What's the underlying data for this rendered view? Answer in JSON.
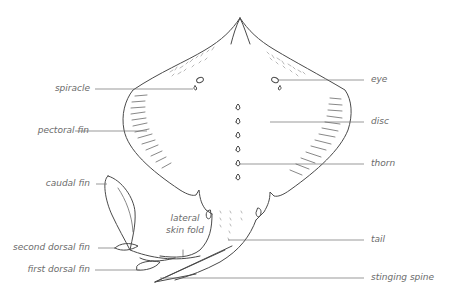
{
  "diagram": {
    "colors": {
      "outline": "#4a4a4a",
      "leader": "#6e6e6e",
      "label_text": "#6b6b6b",
      "background": "#ffffff"
    },
    "labels_left": [
      {
        "id": "spiracle",
        "text": "spiracle"
      },
      {
        "id": "pectoral-fin",
        "text": "pectoral fin"
      },
      {
        "id": "caudal-fin",
        "text": "caudal fin"
      },
      {
        "id": "second-dorsal-fin",
        "text": "second dorsal fin"
      },
      {
        "id": "first-dorsal-fin",
        "text": "first dorsal fin"
      }
    ],
    "labels_right": [
      {
        "id": "eye",
        "text": "eye"
      },
      {
        "id": "disc",
        "text": "disc"
      },
      {
        "id": "thorn",
        "text": "thorn"
      },
      {
        "id": "tail",
        "text": "tail"
      },
      {
        "id": "stinging-spine",
        "text": "stinging spine"
      }
    ],
    "labels_inline": [
      {
        "id": "lateral-skin-fold",
        "line1": "lateral",
        "line2": "skin fold"
      }
    ]
  }
}
